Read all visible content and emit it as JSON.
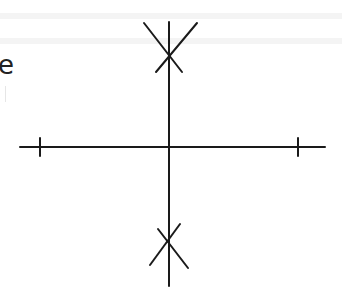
{
  "diagram": {
    "type": "pole-zero plot",
    "partial_text": "e",
    "axes": {
      "horizontal": {
        "x1": 20,
        "x2": 325,
        "y": 147
      },
      "vertical": {
        "x": 169,
        "y1": 22,
        "y2": 286
      },
      "ticks": [
        {
          "name": "left-tick",
          "x": 40,
          "y1": 138,
          "y2": 156
        },
        {
          "name": "right-tick",
          "x": 298,
          "y1": 138,
          "y2": 156
        }
      ]
    },
    "markers": [
      {
        "name": "upper-pole-marker",
        "symbol": "X",
        "center": [
          168,
          48
        ]
      },
      {
        "name": "lower-pole-marker",
        "symbol": "X",
        "center": [
          167,
          245
        ]
      }
    ],
    "colors": {
      "stroke": "#1a1a1a",
      "background": "#ffffff"
    }
  }
}
